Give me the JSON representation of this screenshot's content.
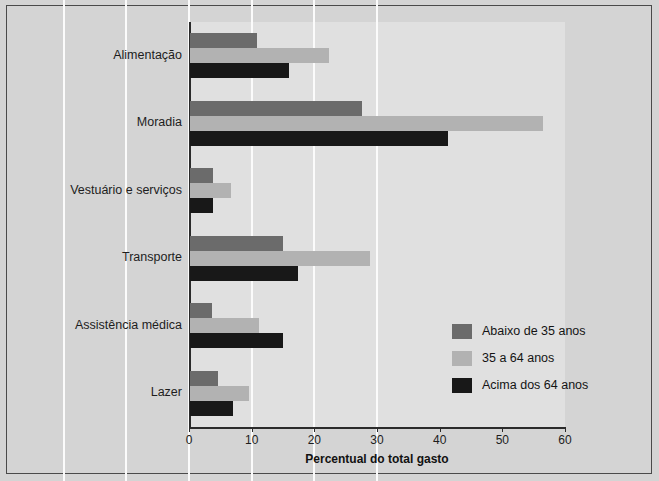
{
  "chart_data": {
    "type": "bar",
    "orientation": "horizontal",
    "title": "",
    "xlabel": "Percentual do total gasto",
    "ylabel": "",
    "xlim": [
      0,
      60
    ],
    "xticks": [
      0,
      10,
      20,
      30,
      40,
      50,
      60
    ],
    "grid": true,
    "legend_position": "lower-right inside plot",
    "categories": [
      "Alimentação",
      "Moradia",
      "Vestuário e serviços",
      "Transporte",
      "Assistência médica",
      "Lazer"
    ],
    "series": [
      {
        "name": "Abaixo de 35 anos",
        "color": "#6b6b6b",
        "values": [
          10.7,
          27.5,
          3.6,
          14.9,
          3.5,
          4.5
        ]
      },
      {
        "name": "35 a 64 anos",
        "color": "#b2b2b2",
        "values": [
          22.2,
          56.3,
          6.6,
          28.8,
          11.0,
          9.4
        ]
      },
      {
        "name": "Acima dos 64 anos",
        "color": "#181818",
        "values": [
          15.8,
          41.2,
          3.6,
          17.3,
          14.8,
          6.9
        ]
      }
    ]
  },
  "figure": {
    "background_color": "#d4d4d4",
    "plot_background_color": "#e0e0e0",
    "gridline_color": "#fbfbfb",
    "axis_color": "#2b2b2b",
    "border_color": "#4a4a4a"
  }
}
